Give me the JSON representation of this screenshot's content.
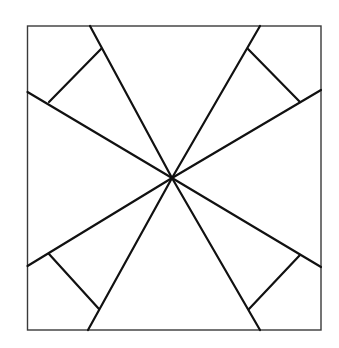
{
  "canvas": {
    "width": 339,
    "height": 348,
    "background": "#ffffff"
  },
  "colors": {
    "frame": "#3a3a3a",
    "lines": "#111111"
  },
  "square": {
    "x": 27.5,
    "y": 26,
    "width": 293.5,
    "height": 304
  },
  "center": {
    "x": 172,
    "y": 178
  },
  "rays": [
    {
      "name": "ray-top-left",
      "x2": 90,
      "y2": 26
    },
    {
      "name": "ray-left-upper",
      "x2": 27.5,
      "y2": 92
    },
    {
      "name": "ray-top-right",
      "x2": 260,
      "y2": 26
    },
    {
      "name": "ray-right-upper",
      "x2": 321,
      "y2": 90
    },
    {
      "name": "ray-left-lower",
      "x2": 27.5,
      "y2": 266
    },
    {
      "name": "ray-bottom-left",
      "x2": 88,
      "y2": 330
    },
    {
      "name": "ray-right-lower",
      "x2": 321,
      "y2": 267
    },
    {
      "name": "ray-bottom-right",
      "x2": 260,
      "y2": 330
    }
  ],
  "perpendiculars": [
    {
      "name": "perp-top-left",
      "x1": 101,
      "y1": 49,
      "x2": 49,
      "y2": 102
    },
    {
      "name": "perp-top-right",
      "x1": 248,
      "y1": 49,
      "x2": 300,
      "y2": 102
    },
    {
      "name": "perp-bottom-left",
      "x1": 49,
      "y1": 254,
      "x2": 99,
      "y2": 309
    },
    {
      "name": "perp-bottom-right",
      "x1": 300,
      "y1": 255,
      "x2": 249,
      "y2": 309
    }
  ]
}
